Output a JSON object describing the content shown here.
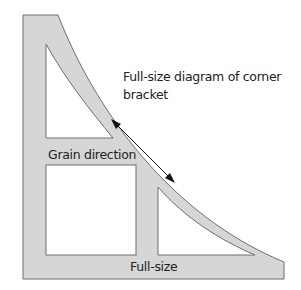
{
  "diagram": {
    "title_line1": "Full-size diagram of corner",
    "title_line2": "bracket",
    "grain_label": "Grain direction",
    "size_label": "Full-size",
    "colors": {
      "bracket_fill": "#d6d6d6",
      "outline": "#6e6e6e",
      "cutout_fill": "#ffffff",
      "arrow": "#111111",
      "text": "#222222"
    }
  }
}
